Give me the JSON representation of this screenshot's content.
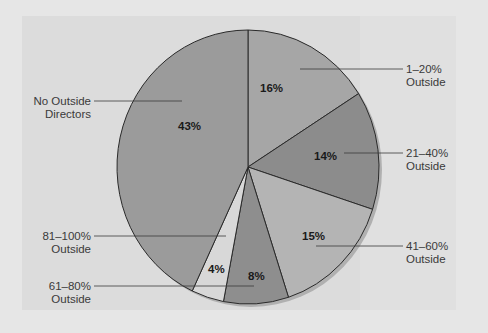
{
  "chart_data": {
    "type": "pie",
    "title": "",
    "categories": [
      "1–20% Outside",
      "21–40% Outside",
      "41–60% Outside",
      "61–80% Outside",
      "81–100% Outside",
      "No Outside Directors"
    ],
    "values": [
      16,
      14,
      15,
      8,
      4,
      43
    ],
    "value_labels": [
      "16%",
      "14%",
      "15%",
      "8%",
      "4%",
      "43%"
    ],
    "start_angle_deg": 0,
    "direction": "clockwise",
    "legend": "none (leader-line labels)",
    "colors": [
      "#a6a6a6",
      "#8c8c8c",
      "#b4b4b4",
      "#8e8e8e",
      "#d8d8d8",
      "#9b9b9b"
    ]
  },
  "labels": {
    "s16": {
      "line1": "1–20%",
      "line2": "Outside",
      "pct": "16%"
    },
    "s14": {
      "line1": "21–40%",
      "line2": "Outside",
      "pct": "14%"
    },
    "s15": {
      "line1": "41–60%",
      "line2": "Outside",
      "pct": "15%"
    },
    "s8": {
      "line1": "61–80%",
      "line2": "Outside",
      "pct": "8%"
    },
    "s4": {
      "line1": "81–100%",
      "line2": "Outside",
      "pct": "4%"
    },
    "s43": {
      "line1": "No Outside",
      "line2": "Directors",
      "pct": "43%"
    }
  },
  "style": {
    "background": "#e6e6e6",
    "panel": "#dcdcdc",
    "outline": "#2a2a2a",
    "shadow": "#b0b0b0"
  }
}
